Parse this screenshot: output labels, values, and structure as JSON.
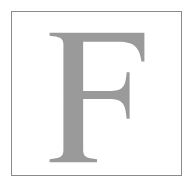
{
  "figure": {
    "letter": "F",
    "letter_color": "#9a9a9a",
    "border_color": "#8a8a8a",
    "background_color": "#ffffff"
  }
}
